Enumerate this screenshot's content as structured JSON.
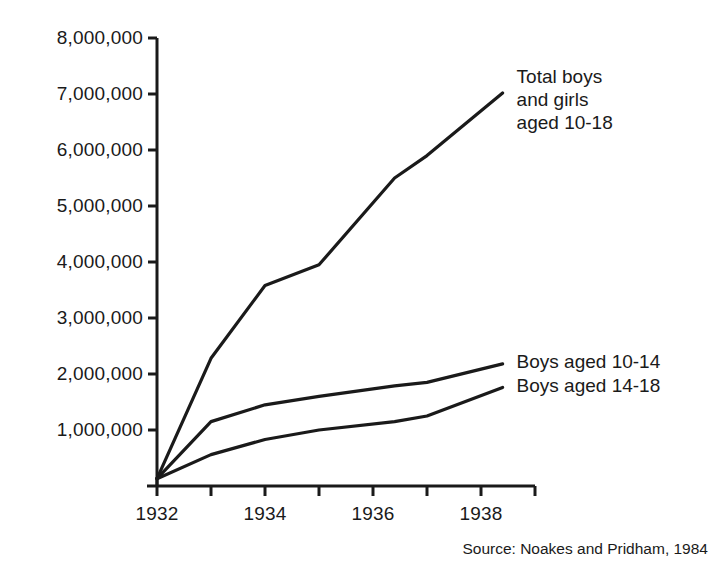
{
  "figure": {
    "source_note": "Source: Noakes and Pridham, 1984",
    "axis_color": "#1a1a1a",
    "line_color": "#1a1a1a",
    "background": "#ffffff"
  },
  "chart_data": {
    "type": "line",
    "title": "",
    "subtitle": "",
    "xlabel": "",
    "ylabel": "",
    "xlim": [
      1932,
      1938.4
    ],
    "ylim": [
      0,
      8000000
    ],
    "grid": false,
    "legend_position": "inline-right",
    "x_ticks": [
      1932,
      1933,
      1934,
      1935,
      1936,
      1937,
      1938,
      1939
    ],
    "x_tick_labels": [
      "1932",
      "",
      "1934",
      "",
      "1936",
      "",
      "1938",
      ""
    ],
    "x_labelled_ticks": [
      "1932",
      "1934",
      "1936",
      "1938"
    ],
    "y_ticks": [
      1000000,
      2000000,
      3000000,
      4000000,
      5000000,
      6000000,
      7000000,
      8000000
    ],
    "y_tick_labels": [
      "1,000,000",
      "2,000,000",
      "3,000,000",
      "4,000,000",
      "5,000,000",
      "6,000,000",
      "7,000,000",
      "8,000,000"
    ],
    "series": [
      {
        "name": "Total boys and girls aged 10-18",
        "label_text": "Total boys\nand girls\naged 10-18",
        "x": [
          1932,
          1933,
          1934,
          1935,
          1936.4,
          1937,
          1938.4
        ],
        "values": [
          130000,
          2280000,
          3580000,
          3950000,
          5500000,
          5900000,
          7020000
        ]
      },
      {
        "name": "Boys aged 10-14",
        "label_text": "Boys aged 10-14",
        "x": [
          1932,
          1933,
          1934,
          1935,
          1936.4,
          1937,
          1938.4
        ],
        "values": [
          130000,
          1150000,
          1450000,
          1600000,
          1790000,
          1850000,
          2180000
        ]
      },
      {
        "name": "Boys aged 14-18",
        "label_text": "Boys aged 14-18",
        "x": [
          1932,
          1933,
          1934,
          1935,
          1936.4,
          1937,
          1938.4
        ],
        "values": [
          130000,
          560000,
          830000,
          1000000,
          1150000,
          1250000,
          1760000
        ]
      }
    ]
  },
  "labels": {
    "series_total": "Total boys\nand girls\naged 10-18",
    "series_10_14": "Boys aged 10-14",
    "series_14_18": "Boys aged 14-18"
  }
}
